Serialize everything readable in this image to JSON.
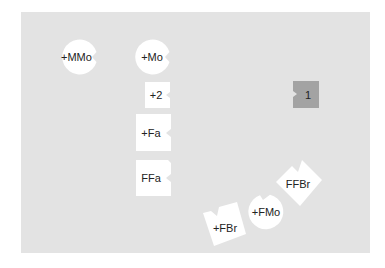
{
  "board": {
    "background": "#e3e3e3"
  },
  "pieces": [
    {
      "label": "+MMo",
      "shape": "circle",
      "notch": "right",
      "color": "#ffffff"
    },
    {
      "label": "+Mo",
      "shape": "circle",
      "notch": "right",
      "color": "#ffffff"
    },
    {
      "label": "+2",
      "shape": "square",
      "notch": "right",
      "color": "#ffffff"
    },
    {
      "label": "+Fa",
      "shape": "square",
      "notch": "right",
      "color": "#ffffff"
    },
    {
      "label": "FFa",
      "shape": "square",
      "notch": "right",
      "color": "#ffffff"
    },
    {
      "label": "1",
      "shape": "square",
      "notch": "left",
      "color": "#a3a3a3"
    },
    {
      "label": "FFBr",
      "shape": "square-rotated",
      "notch": "top",
      "color": "#ffffff"
    },
    {
      "label": "+FMo",
      "shape": "circle",
      "notch": "top",
      "color": "#ffffff"
    },
    {
      "label": "+FBr",
      "shape": "square-rotated",
      "notch": "top",
      "color": "#ffffff"
    }
  ]
}
